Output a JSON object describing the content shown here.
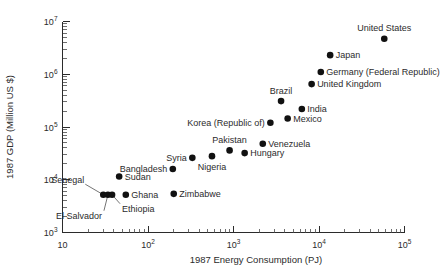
{
  "chart_data": {
    "type": "scatter",
    "title": "",
    "xlabel": "1987 Energy Consumption (PJ)",
    "ylabel": "1987 GDP (Million US $)",
    "xscale": "log",
    "yscale": "log",
    "xlim": [
      10,
      100000
    ],
    "ylim": [
      1000,
      10000000
    ],
    "grid": false,
    "legend": "none",
    "xticks": [
      "10",
      "10^2",
      "10^3",
      "10^4",
      "10^5"
    ],
    "yticks": [
      "10^3",
      "10^4",
      "10^5",
      "10^6",
      "10^7"
    ],
    "xtick_labels": [
      {
        "text": "10",
        "base": "10",
        "exp": ""
      },
      {
        "text": "10^2",
        "base": "10",
        "exp": "2"
      },
      {
        "text": "10^3",
        "base": "10",
        "exp": "3"
      },
      {
        "text": "10^4",
        "base": "10",
        "exp": "4"
      },
      {
        "text": "10^5",
        "base": "10",
        "exp": "5"
      }
    ],
    "ytick_labels": [
      {
        "base": "10",
        "exp": "3"
      },
      {
        "base": "10",
        "exp": "4"
      },
      {
        "base": "10",
        "exp": "5"
      },
      {
        "base": "10",
        "exp": "6"
      },
      {
        "base": "10",
        "exp": "7"
      }
    ],
    "points": [
      {
        "name": "United States",
        "x": 58000,
        "y": 4700000,
        "label": "United States",
        "label_pos": "above"
      },
      {
        "name": "Japan",
        "x": 13500,
        "y": 2300000,
        "label": "Japan",
        "label_pos": "right"
      },
      {
        "name": "Germany (Federal Republic)",
        "x": 10500,
        "y": 1100000,
        "label": "Germany (Federal Republic)",
        "label_pos": "right"
      },
      {
        "name": "United Kingdom",
        "x": 8200,
        "y": 650000,
        "label": "United Kingdom",
        "label_pos": "right"
      },
      {
        "name": "Brazil",
        "x": 3600,
        "y": 310000,
        "label": "Brazil",
        "label_pos": "above"
      },
      {
        "name": "India",
        "x": 6300,
        "y": 220000,
        "label": "India",
        "label_pos": "right"
      },
      {
        "name": "Mexico",
        "x": 4300,
        "y": 145000,
        "label": "Mexico",
        "label_pos": "right"
      },
      {
        "name": "Korea (Republic of)",
        "x": 2700,
        "y": 120000,
        "label": "Korea (Republic of)",
        "label_pos": "left"
      },
      {
        "name": "Venezuela",
        "x": 2200,
        "y": 48000,
        "label": "Venezuela",
        "label_pos": "right"
      },
      {
        "name": "Hungary",
        "x": 1350,
        "y": 32000,
        "label": "Hungary",
        "label_pos": "right"
      },
      {
        "name": "Pakistan",
        "x": 900,
        "y": 36000,
        "label": "Pakistan",
        "label_pos": "above"
      },
      {
        "name": "Nigeria",
        "x": 560,
        "y": 28000,
        "label": "Nigeria",
        "label_pos": "below"
      },
      {
        "name": "Syria",
        "x": 330,
        "y": 26000,
        "label": "Syria",
        "label_pos": "left"
      },
      {
        "name": "Bangladesh",
        "x": 195,
        "y": 16000,
        "label": "Bangladesh",
        "label_pos": "left"
      },
      {
        "name": "Sudan",
        "x": 46,
        "y": 11500,
        "label": "Sudan",
        "label_pos": "right"
      },
      {
        "name": "Senegal",
        "x": 30,
        "y": 5200,
        "label": "Senegal",
        "label_pos": "leader-upleft"
      },
      {
        "name": "El Salvador",
        "x": 34,
        "y": 5200,
        "label": "El Salvador",
        "label_pos": "leader-downleft"
      },
      {
        "name": "Ethiopia",
        "x": 38,
        "y": 5200,
        "label": "Ethiopia",
        "label_pos": "leader-downright"
      },
      {
        "name": "Ghana",
        "x": 55,
        "y": 5200,
        "label": "Ghana",
        "label_pos": "right"
      },
      {
        "name": "Zimbabwe",
        "x": 200,
        "y": 5400,
        "label": "Zimbabwe",
        "label_pos": "right"
      }
    ]
  }
}
